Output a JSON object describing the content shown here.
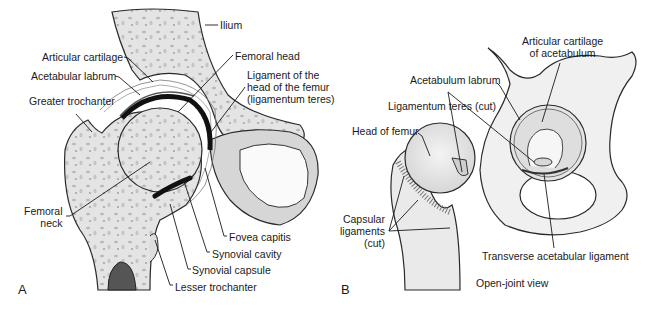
{
  "panel_a": {
    "letter": "A",
    "labels": {
      "ilium": "Ilium",
      "articular_cartilage": "Articular cartilage",
      "acetabular_labrum": "Acetabular labrum",
      "greater_trochanter": "Greater trochanter",
      "femoral_head": "Femoral head",
      "ligament_head_femur": "Ligament of the\nhead of the femur\n(ligamentum teres)",
      "femoral_neck": "Femoral\nneck",
      "fovea_capitis": "Fovea capitis",
      "synovial_cavity": "Synovial cavity",
      "synovial_capsule": "Synovial capsule",
      "lesser_trochanter": "Lesser trochanter"
    }
  },
  "panel_b": {
    "letter": "B",
    "caption": "Open-joint view",
    "labels": {
      "articular_cartilage_acetabulum": "Articular cartilage\nof acetabulum",
      "acetabulum_labrum": "Acetabulum labrum",
      "ligamentum_teres_cut": "Ligamentum teres (cut)",
      "head_of_femur": "Head of femur",
      "capsular_ligaments": "Capsular\nligaments\n(cut)",
      "transverse_acetabular_ligament": "Transverse acetabular ligament"
    }
  },
  "colors": {
    "bone": "#e6e6e6",
    "bone_dark": "#c9c9c9",
    "outline": "#2a2a2a",
    "cartilage": "#111111",
    "label_text": "#1a1a1a"
  }
}
